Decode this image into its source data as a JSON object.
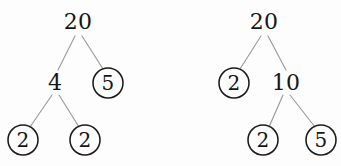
{
  "figure": {
    "background_color": "#fdfdfd",
    "line_color": "#9a9a9a",
    "text_color": "#161616",
    "circle_color": "#1b1b1b",
    "width": 341,
    "height": 166
  },
  "trees": [
    {
      "id": "left-factor-tree",
      "name": "factor-tree-left",
      "root_value": "20",
      "nodes": [
        {
          "id": "L-root",
          "label": "20",
          "circled": false,
          "cx": 78,
          "cy": 22,
          "r": 0
        },
        {
          "id": "L-l",
          "label": "4",
          "circled": false,
          "cx": 55,
          "cy": 83,
          "r": 0
        },
        {
          "id": "L-r",
          "label": "5",
          "circled": true,
          "cx": 108,
          "cy": 83,
          "r": 15
        },
        {
          "id": "L-ll",
          "label": "2",
          "circled": true,
          "cx": 23,
          "cy": 140,
          "r": 15
        },
        {
          "id": "L-lr",
          "label": "2",
          "circled": true,
          "cx": 85,
          "cy": 140,
          "r": 15
        }
      ],
      "edges": [
        {
          "from": "L-root",
          "to": "L-l",
          "x1": 75,
          "y1": 36,
          "x2": 58,
          "y2": 70
        },
        {
          "from": "L-root",
          "to": "L-r",
          "x1": 82,
          "y1": 36,
          "x2": 103,
          "y2": 69
        },
        {
          "from": "L-l",
          "to": "L-ll",
          "x1": 52,
          "y1": 95,
          "x2": 30,
          "y2": 127
        },
        {
          "from": "L-l",
          "to": "L-lr",
          "x1": 59,
          "y1": 95,
          "x2": 79,
          "y2": 127
        }
      ]
    },
    {
      "id": "right-factor-tree",
      "name": "factor-tree-right",
      "root_value": "20",
      "nodes": [
        {
          "id": "R-root",
          "label": "20",
          "circled": false,
          "cx": 264,
          "cy": 22,
          "r": 0
        },
        {
          "id": "R-l",
          "label": "2",
          "circled": true,
          "cx": 234,
          "cy": 83,
          "r": 15
        },
        {
          "id": "R-r",
          "label": "10",
          "circled": false,
          "cx": 286,
          "cy": 83,
          "r": 0
        },
        {
          "id": "R-rl",
          "label": "2",
          "circled": true,
          "cx": 263,
          "cy": 140,
          "r": 15
        },
        {
          "id": "R-rr",
          "label": "5",
          "circled": true,
          "cx": 321,
          "cy": 140,
          "r": 15
        }
      ],
      "edges": [
        {
          "from": "R-root",
          "to": "R-l",
          "x1": 261,
          "y1": 36,
          "x2": 240,
          "y2": 69
        },
        {
          "from": "R-root",
          "to": "R-r",
          "x1": 268,
          "y1": 36,
          "x2": 286,
          "y2": 70
        },
        {
          "from": "R-r",
          "to": "R-rl",
          "x1": 283,
          "y1": 95,
          "x2": 269,
          "y2": 127
        },
        {
          "from": "R-r",
          "to": "R-rr",
          "x1": 290,
          "y1": 95,
          "x2": 315,
          "y2": 127
        }
      ]
    }
  ],
  "chart_data": {
    "type": "diagram",
    "diagram_type": "factor-tree",
    "trees": [
      {
        "name": "Left factor tree",
        "root": "20",
        "structure": "20 -> (4, 5); 4 -> (2, 2)",
        "circled_leaves": [
          "5",
          "2",
          "2"
        ],
        "prime_factorization": "2 x 2 x 5"
      },
      {
        "name": "Right factor tree",
        "root": "20",
        "structure": "20 -> (2, 10); 10 -> (2, 5)",
        "circled_leaves": [
          "2",
          "2",
          "5"
        ],
        "prime_factorization": "2 x 2 x 5"
      }
    ],
    "note": "Circled values denote prime factors"
  }
}
